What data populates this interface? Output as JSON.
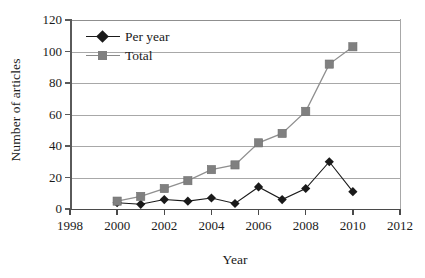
{
  "chart_data": {
    "type": "line",
    "title": "",
    "xlabel": "Year",
    "ylabel": "Number of articles",
    "x": [
      2000,
      2001,
      2002,
      2003,
      2004,
      2005,
      2006,
      2007,
      2008,
      2009,
      2010
    ],
    "series": [
      {
        "name": "Per year",
        "color": "#1a1a1a",
        "marker": "diamond",
        "values": [
          4,
          3,
          6,
          5,
          7,
          3.5,
          14,
          6,
          13,
          30,
          11
        ]
      },
      {
        "name": "Total",
        "color": "#808080",
        "marker": "square",
        "values": [
          5,
          8,
          13,
          18,
          25,
          28,
          42,
          48,
          62,
          92,
          103
        ]
      }
    ],
    "xlim": [
      1998,
      2012
    ],
    "ylim": [
      0,
      120
    ],
    "xticks": [
      1998,
      2000,
      2002,
      2004,
      2006,
      2008,
      2010,
      2012
    ],
    "yticks": [
      0,
      20,
      40,
      60,
      80,
      100,
      120
    ],
    "xtick_labels": [
      "1998",
      "2000",
      "2002",
      "2004",
      "2006",
      "2008",
      "2010",
      "2012"
    ],
    "ytick_labels": [
      "0",
      "20",
      "40",
      "60",
      "80",
      "100",
      "120"
    ],
    "grid": "horizontal",
    "legend_position": "top-left",
    "legend_entries": [
      "Per year",
      "Total"
    ]
  },
  "axes": {
    "y_title": "Number of articles",
    "x_title": "Year"
  },
  "colors": {
    "per_year": "#1a1a1a",
    "total": "#808080",
    "gridline": "#a8a8a8",
    "axis": "#4a4a4a",
    "background": "#ffffff"
  }
}
